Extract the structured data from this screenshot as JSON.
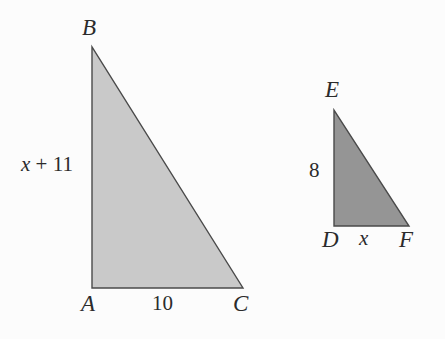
{
  "figure": {
    "background_color": "#fcfcfc",
    "text_color": "#2b2b2b",
    "outline_color": "#4a4a4a",
    "shapes": [
      {
        "name": "triangle-abc",
        "fill_color": "#c9c9c9",
        "vertices": [
          {
            "label": "B",
            "x": 92,
            "y": 47
          },
          {
            "label": "A",
            "x": 92,
            "y": 288
          },
          {
            "label": "C",
            "x": 243,
            "y": 288
          }
        ],
        "side_labels": [
          {
            "name": "leg-ab",
            "text": "x + 11",
            "var_part": "x",
            "rest_part": " + 11"
          },
          {
            "name": "leg-ac",
            "text": "10"
          }
        ]
      },
      {
        "name": "triangle-def",
        "fill_color": "#959595",
        "vertices": [
          {
            "label": "E",
            "x": 334,
            "y": 110
          },
          {
            "label": "D",
            "x": 334,
            "y": 226
          },
          {
            "label": "F",
            "x": 409,
            "y": 226
          }
        ],
        "side_labels": [
          {
            "name": "leg-de",
            "text": "8"
          },
          {
            "name": "leg-df",
            "text": "x"
          }
        ]
      }
    ]
  },
  "labels": {
    "B": "B",
    "A": "A",
    "C": "C",
    "E": "E",
    "D": "D",
    "F": "F",
    "x_plus_11_var": "x",
    "x_plus_11_rest": " + 11",
    "ten": "10",
    "eight": "8",
    "x_small": "x"
  }
}
